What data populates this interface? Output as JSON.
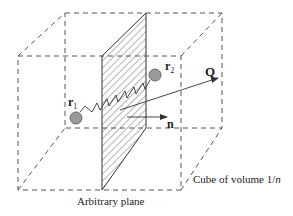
{
  "diagram": {
    "type": "physics-schematic",
    "labels": {
      "r1": "r",
      "r1_sub": "1",
      "r2": "r",
      "r2_sub": "2",
      "q": "Q",
      "n": "n",
      "plane": "Arbitrary plane",
      "cube_prefix": "Cube of volume 1/",
      "cube_var": "n"
    },
    "colors": {
      "line": "#333333",
      "dashed": "#555555",
      "particle_fill": "#9a9a9a",
      "particle_stroke": "#555555",
      "hatch": "#444444",
      "background": "#ffffff"
    },
    "elements": [
      {
        "name": "cube",
        "kind": "dashed-wireframe"
      },
      {
        "name": "arbitrary-plane",
        "kind": "hatched-parallelogram"
      },
      {
        "name": "particle-r1",
        "kind": "circle"
      },
      {
        "name": "particle-r2",
        "kind": "circle"
      },
      {
        "name": "spring",
        "kind": "zigzag-connector",
        "from": "particle-r1",
        "to": "particle-r2"
      },
      {
        "name": "q-vector",
        "kind": "arrow"
      },
      {
        "name": "n-vector",
        "kind": "arrow"
      }
    ]
  }
}
